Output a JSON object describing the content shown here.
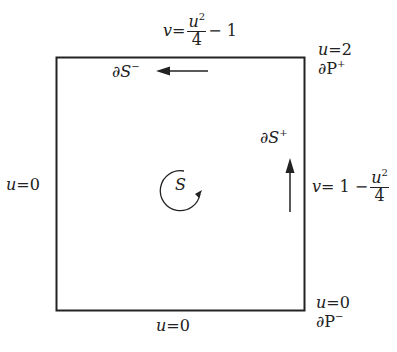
{
  "diagram": {
    "region": {
      "label": "S",
      "orientation": "counterclockwise"
    },
    "edges": {
      "top": {
        "lhs": "v",
        "eq": "=",
        "num_var": "u",
        "num_exp": "2",
        "den": "4",
        "rest": "− 1"
      },
      "right": {
        "lhs": "v",
        "eq": "= 1 −",
        "num_var": "u",
        "num_exp": "2",
        "den": "4"
      },
      "bottom": {
        "var": "u",
        "eq": "=",
        "val": "0"
      },
      "left": {
        "var": "u",
        "eq": "=",
        "val": "0"
      }
    },
    "corners": {
      "top_right": {
        "var": "u",
        "eq": "=",
        "val": "2",
        "boundary": "∂P",
        "sign": "+"
      },
      "bottom_right": {
        "var": "u",
        "eq": "=",
        "val": "0",
        "boundary": "∂P",
        "sign": "−"
      }
    },
    "boundary_arrows": {
      "top": {
        "label": "∂S",
        "sign": "−",
        "direction": "left"
      },
      "right": {
        "label": "∂S",
        "sign": "+",
        "direction": "up"
      }
    },
    "colors": {
      "ink": "#222222",
      "background": "#ffffff"
    }
  }
}
